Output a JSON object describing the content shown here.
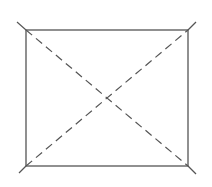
{
  "diagram": {
    "type": "rectangle-with-diagonals",
    "stroke_color": "#555555",
    "rectangle": {
      "x": 26,
      "y": 30,
      "width": 162,
      "height": 136
    },
    "diagonals": [
      {
        "name": "top-left-to-bottom-right",
        "x1": 17,
        "y1": 22,
        "x2": 196,
        "y2": 174,
        "style": "dashed"
      },
      {
        "name": "bottom-left-to-top-right",
        "x1": 19,
        "y1": 173,
        "x2": 196,
        "y2": 22,
        "style": "dashed"
      }
    ],
    "labels": []
  }
}
